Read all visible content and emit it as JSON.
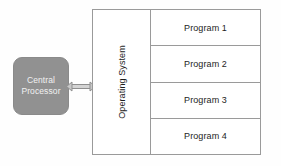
{
  "diagram": {
    "background_color": "#fefefe",
    "line_color": "#9a9a9a",
    "text_color": "#1d1d1d",
    "processor": {
      "fill_color": "#919191",
      "text_color": "#f2f2f2",
      "line_1": "Central",
      "line_2": "Processor"
    },
    "connector": {
      "name": "bidirectional-arrow",
      "color": "#8f8f8f",
      "direction": "both"
    },
    "operating_system": {
      "label": "Operating System",
      "orientation": "vertical-bottom-to-top"
    },
    "programs": [
      {
        "label": "Program 1"
      },
      {
        "label": "Program 2"
      },
      {
        "label": "Program 3"
      },
      {
        "label": "Program 4"
      }
    ]
  }
}
